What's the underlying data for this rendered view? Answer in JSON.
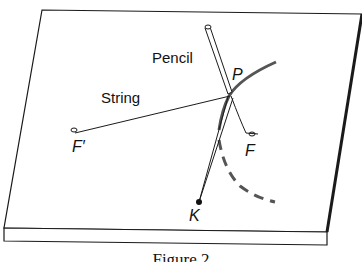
{
  "diagram": {
    "labels": {
      "pencil": "Pencil",
      "string": "String",
      "point_p": "P",
      "focus_f_prime": "F′",
      "focus_f": "F",
      "point_k": "K"
    },
    "caption": "Figure 2",
    "colors": {
      "line": "#1a1a1a",
      "curve": "#555555",
      "board": "#ffffff"
    }
  }
}
